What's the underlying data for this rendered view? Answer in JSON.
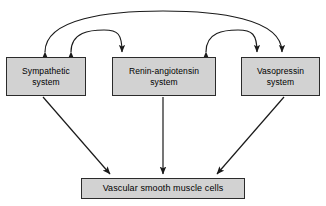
{
  "diagram": {
    "colors": {
      "box_fill": "#d2d2d2",
      "box_border": "#2b2b2b",
      "arrow": "#1a1a1a",
      "background": "#ffffff",
      "text": "#000000"
    },
    "nodes": [
      {
        "id": "sympathetic",
        "label": "Sympathetic\nsystem",
        "line1": "Sympathetic",
        "line2": "system",
        "row": "top",
        "column": 1
      },
      {
        "id": "renin-angiotensin",
        "label": "Renin-angiotensin\nsystem",
        "line1": "Renin-angiotensin",
        "line2": "system",
        "row": "top",
        "column": 2
      },
      {
        "id": "vasopressin",
        "label": "Vasopressin\nsystem",
        "line1": "Vasopressin",
        "line2": "system",
        "row": "top",
        "column": 3
      },
      {
        "id": "vascular-smooth-muscle-cells",
        "label": "Vascular smooth muscle cells",
        "row": "bottom",
        "column": 0
      }
    ],
    "connections": [
      {
        "id": "arc-sympathetic-vasopressin",
        "from": "sympathetic",
        "to": "vasopressin",
        "style": "curved-arc",
        "direction": "bidirectional",
        "description": "Outer arc linking sympathetic system and vasopressin system"
      },
      {
        "id": "arc-sympathetic-renin",
        "from": "sympathetic",
        "to": "renin-angiotensin",
        "style": "curved-arc",
        "direction": "bidirectional",
        "description": "Inner arc linking sympathetic system and renin-angiotensin system"
      },
      {
        "id": "arc-renin-vasopressin",
        "from": "renin-angiotensin",
        "to": "vasopressin",
        "style": "curved-arc",
        "direction": "bidirectional",
        "description": "Inner arc linking renin-angiotensin system and vasopressin system"
      },
      {
        "id": "arrow-sympathetic-vascular",
        "from": "sympathetic",
        "to": "vascular-smooth-muscle-cells",
        "style": "straight",
        "direction": "unidirectional",
        "description": "Diagonal arrow down-right to vascular smooth muscle cells"
      },
      {
        "id": "arrow-renin-vascular",
        "from": "renin-angiotensin",
        "to": "vascular-smooth-muscle-cells",
        "style": "straight",
        "direction": "unidirectional",
        "description": "Vertical arrow down to vascular smooth muscle cells"
      },
      {
        "id": "arrow-vasopressin-vascular",
        "from": "vasopressin",
        "to": "vascular-smooth-muscle-cells",
        "style": "straight",
        "direction": "unidirectional",
        "description": "Diagonal arrow down-left to vascular smooth muscle cells"
      }
    ]
  }
}
